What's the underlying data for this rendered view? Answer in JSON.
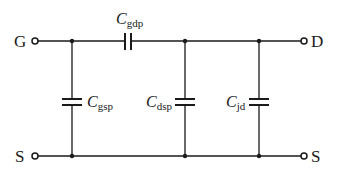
{
  "diagram": {
    "type": "circuit-schematic",
    "terminals": {
      "gate": "G",
      "drain": "D",
      "source_left": "S",
      "source_right": "S"
    },
    "capacitors": [
      {
        "id": "gdp",
        "symbol": "C",
        "subscript": "gdp",
        "between": "G-D"
      },
      {
        "id": "gsp",
        "symbol": "C",
        "subscript": "gsp",
        "between": "G-S"
      },
      {
        "id": "dsp",
        "symbol": "C",
        "subscript": "dsp",
        "between": "D-S"
      },
      {
        "id": "jd",
        "symbol": "C",
        "subscript": "jd",
        "between": "D-S"
      }
    ],
    "colors": {
      "line": "#1a1a1a",
      "background": "#ffffff"
    }
  }
}
